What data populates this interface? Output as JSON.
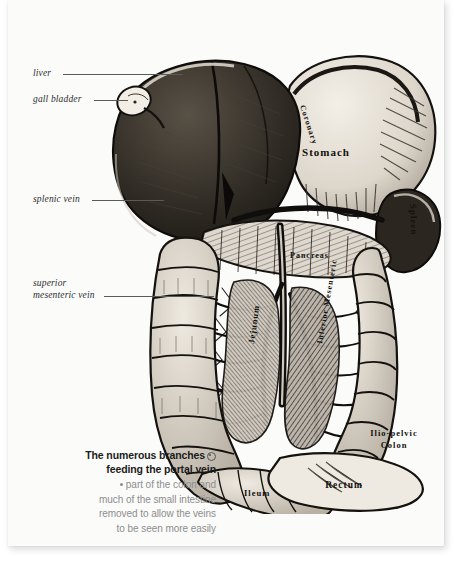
{
  "page": {
    "background_color": "#fbfbfa",
    "backdrop_color": "#ffffff"
  },
  "callouts": [
    {
      "name": "liver",
      "label": "liver"
    },
    {
      "name": "gall-bladder",
      "label": "gall bladder"
    },
    {
      "name": "splenic-vein",
      "label": "splenic vein"
    },
    {
      "name": "superior-mesenteric-vein-line1",
      "label": "superior"
    },
    {
      "name": "superior-mesenteric-vein-line2",
      "label": "mesenteric vein"
    }
  ],
  "caption": {
    "headline_line1": "The numerous branches",
    "headline_line2": "feeding the portal vein",
    "body_line1": "part of the colon and",
    "body_line2": "much of the small intestine",
    "body_line3": "removed to allow the veins",
    "body_line4": "to be seen more easily",
    "symbol_name": "circled-dot-symbol",
    "bullet_name": "bullet-dot",
    "headline_color": "#1b1b1b",
    "body_color": "#8d8d8d"
  },
  "illustration": {
    "title": "portal-vein-anatomical-engraving",
    "engraved_labels": [
      {
        "name": "stomach",
        "text": "Stomach"
      },
      {
        "name": "coronary",
        "text": "Coronary"
      },
      {
        "name": "spleen",
        "text": "Spleen"
      },
      {
        "name": "pancreas",
        "text": "Pancreas"
      },
      {
        "name": "jejunum",
        "text": "Jejunum"
      },
      {
        "name": "inferior-mesenteric",
        "text": "Inferior Mesenteric"
      },
      {
        "name": "ilio-pelvic-colon-line1",
        "text": "Ilio-pelvic"
      },
      {
        "name": "ilio-pelvic-colon-line2",
        "text": "Colon"
      },
      {
        "name": "ileum",
        "text": "Ileum"
      },
      {
        "name": "rectum",
        "text": "Rectum"
      }
    ],
    "ink_color": "#1a1714",
    "mid_tone": "#6f6a63",
    "pale_tone": "#e8e4dc"
  }
}
